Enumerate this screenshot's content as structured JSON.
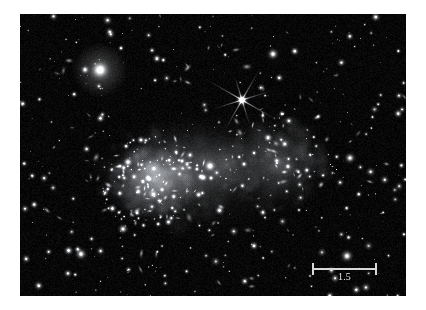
{
  "figure": {
    "kind": "astronomical-optical-image",
    "object_name": "Bullet Cluster",
    "background_color": "#000000",
    "page_background": "#ffffff",
    "frame": {
      "x": 20,
      "y": 14,
      "width": 386,
      "height": 282
    }
  },
  "scale_bar": {
    "label": "1.5",
    "color": "#d8d8d8",
    "x": 292,
    "y": 242,
    "length_px": 65
  },
  "chart_data": {
    "type": "scatter",
    "title": "",
    "xlabel": "",
    "ylabel": "",
    "xlim": [
      0,
      386
    ],
    "ylim": [
      0,
      282
    ],
    "grid": false,
    "legend": "none",
    "colormap": "grayscale",
    "annotations": [
      {
        "text": "1.5",
        "x": 325,
        "y": 256,
        "role": "scale-bar-label"
      }
    ],
    "diffuse_halos": [
      {
        "name": "main-cluster-halo",
        "cx": 150,
        "cy": 160,
        "rx": 78,
        "ry": 56,
        "rot": -14,
        "peak": 0.34
      },
      {
        "name": "main-cluster-core-glow",
        "cx": 132,
        "cy": 166,
        "rx": 46,
        "ry": 38,
        "rot": -10,
        "peak": 0.42
      },
      {
        "name": "bullet-subcluster-halo",
        "cx": 258,
        "cy": 148,
        "rx": 54,
        "ry": 50,
        "rot": 8,
        "peak": 0.3
      },
      {
        "name": "bridge-glow",
        "cx": 205,
        "cy": 152,
        "rx": 44,
        "ry": 38,
        "rot": 0,
        "peak": 0.2
      },
      {
        "name": "outer-envelope",
        "cx": 190,
        "cy": 158,
        "rx": 112,
        "ry": 70,
        "rot": -8,
        "peak": 0.14
      }
    ],
    "bright_stars": [
      {
        "name": "star-top-left-bright",
        "x": 80,
        "y": 56,
        "r": 13.0,
        "mag": 1.0,
        "spikes": false
      },
      {
        "name": "star-diffraction-spike",
        "x": 222,
        "y": 86,
        "r": 8.0,
        "mag": 1.0,
        "spikes": true
      },
      {
        "name": "star-upper-right",
        "x": 253,
        "y": 40,
        "r": 7.5,
        "mag": 0.95,
        "spikes": false
      },
      {
        "name": "star-mid-right",
        "x": 330,
        "y": 144,
        "r": 7.0,
        "mag": 0.92,
        "spikes": false
      },
      {
        "name": "star-lower-right",
        "x": 327,
        "y": 242,
        "r": 8.0,
        "mag": 0.95,
        "spikes": false
      },
      {
        "name": "star-lower-left",
        "x": 61,
        "y": 240,
        "r": 7.5,
        "mag": 0.93,
        "spikes": false
      },
      {
        "name": "star-center-bright",
        "x": 190,
        "y": 152,
        "r": 7.5,
        "mag": 0.97,
        "spikes": false
      },
      {
        "name": "star-cluster-bright",
        "x": 108,
        "y": 148,
        "r": 6.5,
        "mag": 0.93,
        "spikes": false
      },
      {
        "name": "star-bottom-center",
        "x": 103,
        "y": 215,
        "r": 6.5,
        "mag": 0.92,
        "spikes": false
      }
    ],
    "series": [
      {
        "name": "point-sources",
        "description": "Foreground stars and cluster member galaxies rendered as gaussian point sources on black sky.",
        "count_approx": 520
      }
    ]
  }
}
